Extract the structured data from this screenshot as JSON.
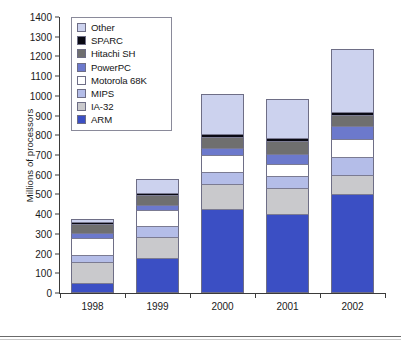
{
  "chart_data": {
    "type": "bar",
    "subtype": "stacked-bar",
    "title": "",
    "xlabel": "",
    "ylabel": "Millions of processors",
    "categories": [
      "1998",
      "1999",
      "2000",
      "2001",
      "2002"
    ],
    "ylim": [
      0,
      1400
    ],
    "ytick_step": 100,
    "yticks": [
      0,
      100,
      200,
      300,
      400,
      500,
      600,
      700,
      800,
      900,
      1000,
      1100,
      1200,
      1300,
      1400
    ],
    "grid": false,
    "legend_position": "top-left-inside",
    "stack_order_bottom_to_top": [
      "ARM",
      "IA-32",
      "MIPS",
      "Motorola 68K",
      "PowerPC",
      "Hitachi SH",
      "SPARC",
      "Other"
    ],
    "series": [
      {
        "name": "ARM",
        "color": "#3b4fc4",
        "values": [
          50,
          180,
          425,
          400,
          500
        ]
      },
      {
        "name": "IA-32",
        "color": "#c9c9cc",
        "values": [
          105,
          105,
          130,
          135,
          100
        ]
      },
      {
        "name": "MIPS",
        "color": "#b4bde8",
        "values": [
          40,
          55,
          60,
          60,
          90
        ]
      },
      {
        "name": "Motorola 68K",
        "color": "#ffffff",
        "values": [
          85,
          80,
          85,
          60,
          90
        ]
      },
      {
        "name": "PowerPC",
        "color": "#6c79cc",
        "values": [
          25,
          25,
          35,
          50,
          65
        ]
      },
      {
        "name": "Hitachi SH",
        "color": "#6f6f6f",
        "values": [
          45,
          50,
          55,
          65,
          60
        ]
      },
      {
        "name": "SPARC",
        "color": "#0a0a14",
        "values": [
          10,
          12,
          15,
          15,
          15
        ]
      },
      {
        "name": "Other",
        "color": "#ccd2ee",
        "values": [
          15,
          73,
          205,
          200,
          320
        ]
      }
    ],
    "totals": [
      375,
      580,
      1010,
      985,
      1240
    ],
    "legend_entries": [
      {
        "label": "Other",
        "color": "#ccd2ee"
      },
      {
        "label": "SPARC",
        "color": "#0a0a14"
      },
      {
        "label": "Hitachi SH",
        "color": "#6f6f6f"
      },
      {
        "label": "PowerPC",
        "color": "#6c79cc"
      },
      {
        "label": "Motorola 68K",
        "color": "#ffffff"
      },
      {
        "label": "MIPS",
        "color": "#b4bde8"
      },
      {
        "label": "IA-32",
        "color": "#c9c9cc"
      },
      {
        "label": "ARM",
        "color": "#3b4fc4"
      }
    ]
  },
  "axis": {
    "y_label": "Millions of processors"
  }
}
